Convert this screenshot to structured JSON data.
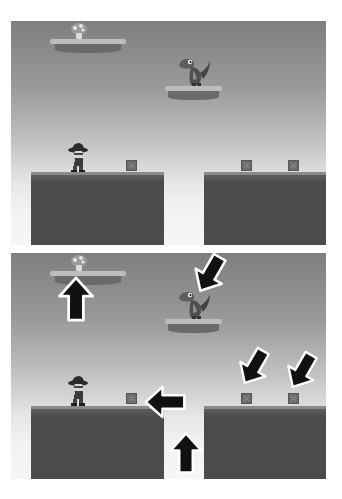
{
  "scene": {
    "description": "Two side-by-side stacked platformer game frames; the lower one is annotated with arrows pointing at game objects",
    "colors": {
      "sky_top": "#7f7f7f",
      "sky_bottom": "#f6f6f6",
      "ground": "#4b4b4b",
      "platform_top": "#bdbdbd",
      "arrow_fill": "#111111",
      "arrow_outline": "#ffffff"
    }
  },
  "panels": [
    {
      "id": "top",
      "annotated": false,
      "objects": [
        {
          "type": "floating-platform",
          "holds": "mushroom"
        },
        {
          "type": "floating-platform",
          "holds": "dinosaur-enemy"
        },
        {
          "type": "player",
          "label": "player character with hat"
        },
        {
          "type": "crate",
          "count": 3
        },
        {
          "type": "ground",
          "count": 2
        }
      ]
    },
    {
      "id": "bottom",
      "annotated": true,
      "arrows": [
        {
          "target": "mushroom",
          "direction": "up"
        },
        {
          "target": "dinosaur-enemy",
          "direction": "down-left"
        },
        {
          "target": "crate-left",
          "direction": "left"
        },
        {
          "target": "gap",
          "direction": "up"
        },
        {
          "target": "crate-right-1",
          "direction": "down-left"
        },
        {
          "target": "crate-right-2",
          "direction": "down-left"
        }
      ]
    }
  ]
}
